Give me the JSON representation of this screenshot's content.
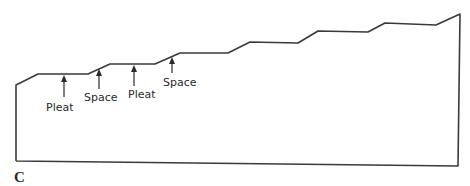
{
  "diagram": {
    "figure_label": "C",
    "annotations": [
      {
        "label": "Pleat",
        "arrow_x": 64,
        "arrow_top": 75,
        "arrow_bottom": 97,
        "text_x": 46,
        "text_y": 111
      },
      {
        "label": "Space",
        "arrow_x": 99,
        "arrow_top": 69,
        "arrow_bottom": 89,
        "text_x": 84,
        "text_y": 101
      },
      {
        "label": "Pleat",
        "arrow_x": 134,
        "arrow_top": 65,
        "arrow_bottom": 86,
        "text_x": 128,
        "text_y": 98
      },
      {
        "label": "Space",
        "arrow_x": 172,
        "arrow_top": 57,
        "arrow_bottom": 73,
        "text_x": 163,
        "text_y": 86
      }
    ],
    "outline_points": "16,161 16,85 38,74 88,74 110,64 155,64 180,53 228,53 250,42 298,43 318,31 368,32 385,23 436,25 460,14 458,166 16,161",
    "stroke_color": "#3a3a3a"
  }
}
